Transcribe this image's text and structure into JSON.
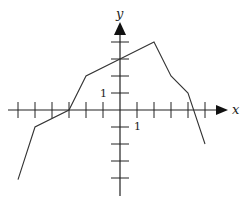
{
  "figure": {
    "x_axis_label": "x",
    "y_axis_label": "y",
    "x_unit_label": "1",
    "y_unit_label": "1"
  },
  "chart_data": {
    "type": "line",
    "title": "",
    "xlabel": "x",
    "ylabel": "y",
    "xlim": [
      -6,
      6
    ],
    "ylim": [
      -4,
      4
    ],
    "grid": false,
    "x_ticks": [
      -6,
      -5,
      -4,
      -3,
      -2,
      -1,
      1,
      2,
      3,
      4,
      5
    ],
    "y_ticks": [
      -4,
      -3,
      -2,
      -1,
      1,
      2,
      3,
      4
    ],
    "labeled_ticks": {
      "x": [
        1
      ],
      "y": [
        1
      ]
    },
    "series": [
      {
        "name": "piecewise-linear function",
        "points": [
          [
            -6,
            -4.1
          ],
          [
            -5,
            -1
          ],
          [
            -3,
            0
          ],
          [
            -2,
            2
          ],
          [
            0,
            3
          ],
          [
            2,
            4
          ],
          [
            3,
            2
          ],
          [
            4,
            1
          ],
          [
            5,
            -2
          ]
        ]
      }
    ]
  },
  "geometry": {
    "origin": [
      120,
      110
    ],
    "unit": 17,
    "x_axis": {
      "from": 8,
      "to": 228
    },
    "y_axis": {
      "from": 196,
      "to": 22
    }
  }
}
